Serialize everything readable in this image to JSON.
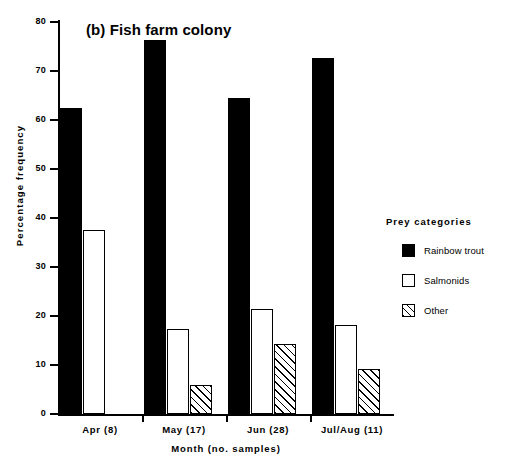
{
  "chart_data": {
    "type": "bar",
    "title": "(b) Fish farm colony",
    "xlabel": "Month  (no. samples)",
    "ylabel": "Percentage  frequency",
    "ylim": [
      0,
      80
    ],
    "ytick_labels": [
      "0",
      "10",
      "20",
      "30",
      "40",
      "50",
      "60",
      "70",
      "80"
    ],
    "ytick_values": [
      0,
      10,
      20,
      30,
      40,
      50,
      60,
      70,
      80
    ],
    "grid": false,
    "legend_position": "right",
    "legend_title": "Prey  categories",
    "categories": [
      "Apr  (8)",
      "May  (17)",
      "Jun  (28)",
      "Jul/Aug  (11)"
    ],
    "category_months": [
      "Apr",
      "May",
      "Jun",
      "Jul/Aug"
    ],
    "category_sample_counts": [
      "(8)",
      "(17)",
      "(28)",
      "(11)"
    ],
    "series": [
      {
        "name": "Rainbow trout",
        "fill": "solid",
        "values": [
          62.5,
          76.3,
          64.4,
          72.6
        ]
      },
      {
        "name": "Salmonids",
        "fill": "open",
        "values": [
          37.5,
          17.3,
          21.5,
          18.1
        ]
      },
      {
        "name": "Other",
        "fill": "hatch",
        "values": [
          0,
          5.9,
          14.3,
          9.2
        ]
      }
    ]
  },
  "colors": {
    "axis": "#000000",
    "solid": "#000000",
    "open": "#ffffff",
    "background": "#ffffff"
  }
}
